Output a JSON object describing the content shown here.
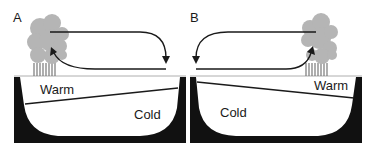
{
  "panels": [
    {
      "letter": "A",
      "warm_label": "Warm",
      "cold_label": "Cold",
      "convection_side": "left"
    },
    {
      "letter": "B",
      "warm_label": "Warm",
      "cold_label": "Cold",
      "convection_side": "right"
    }
  ],
  "colors": {
    "basin": "#111111",
    "cloud": "#b5b5b5",
    "water": "#ffffff",
    "arrow": "#1a1a1a"
  }
}
